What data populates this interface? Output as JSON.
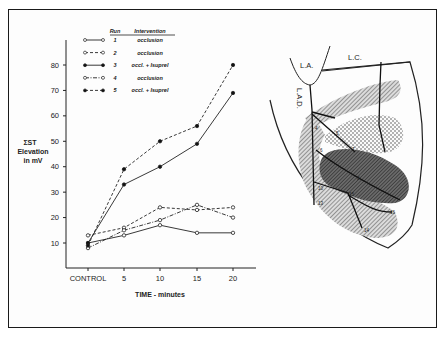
{
  "chart_data": [
    {
      "type": "line",
      "title": "",
      "xlabel": "TIME - minutes",
      "ylabel": "ΣST Elevation in mV",
      "ylabel_lines": [
        "ΣST",
        "Elevation",
        "in mV"
      ],
      "categories": [
        "CONTROL",
        "5",
        "10",
        "15",
        "20"
      ],
      "yticks": [
        10,
        20,
        30,
        40,
        50,
        60,
        70,
        80
      ],
      "ylim": [
        0,
        90
      ],
      "grid": false,
      "legend_position": "upper-left",
      "legend_headers": {
        "run": "Run",
        "intervention": "Intervention"
      },
      "series": [
        {
          "name": "1",
          "run": "1",
          "intervention": "occlusion",
          "line": "solid",
          "marker": "open-circle",
          "values": [
            10,
            13,
            17,
            14,
            14
          ]
        },
        {
          "name": "2",
          "run": "2",
          "intervention": "occlusion",
          "line": "dashed",
          "marker": "open-circle",
          "values": [
            13,
            16,
            24,
            23,
            24
          ]
        },
        {
          "name": "3",
          "run": "3",
          "intervention": "occl. + Isuprel",
          "line": "solid",
          "marker": "filled-circle",
          "values": [
            10,
            33,
            40,
            49,
            69
          ]
        },
        {
          "name": "4",
          "run": "4",
          "intervention": "occlusion",
          "line": "dash-dot",
          "marker": "open-circle",
          "values": [
            8,
            15,
            19,
            25,
            20
          ]
        },
        {
          "name": "5",
          "run": "5",
          "intervention": "occl. + Isuprel",
          "line": "dashed",
          "marker": "filled-circle",
          "values": [
            9,
            39,
            50,
            56,
            80
          ]
        }
      ]
    },
    {
      "type": "diagram",
      "title": "Heart schematic with coronary arteries and ischemic zones",
      "labels": [
        "L.A.",
        "L.C.",
        "L.A.D."
      ],
      "electrode_labels": [
        "4",
        "5",
        "6",
        "7",
        "8",
        "10",
        "13",
        "14",
        "15",
        "16"
      ]
    }
  ]
}
